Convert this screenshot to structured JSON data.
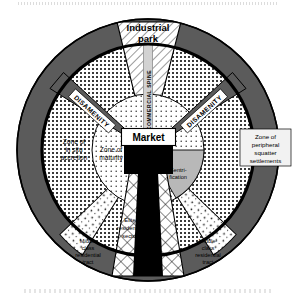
{
  "figure": {
    "type": "concentric-sector diagram"
  },
  "center": {
    "market_label": "Market",
    "cbd_label": "CBD"
  },
  "zones": {
    "industrial_park": "Industrial\npark",
    "industrial_park_line1": "Industrial",
    "industrial_park_line2": "park",
    "commercial_spine": "COMMERCIAL SPINE",
    "disamenity_left": "DISAMENITY",
    "disamenity_right": "DISAMENITY",
    "in_situ_line1": "Zone of",
    "in_situ_line2": "in situ",
    "in_situ_line3": "accretion",
    "maturity_line1": "Zone of",
    "maturity_line2": "maturity",
    "gentrification_line1": "Gentri-",
    "gentrification_line2": "fication",
    "squatter_line1": "Zone of",
    "squatter_line2": "peripheral",
    "squatter_line3": "squatter",
    "squatter_line4": "settlements",
    "elite_line1": "Elite",
    "elite_line2": "residential",
    "elite_line3": "sector",
    "middle_left_line1": "Middle",
    "middle_left_line2": "class",
    "middle_left_line3": "residential",
    "middle_left_line4": "tract",
    "middle_right_line1": "Middle-",
    "middle_right_line2": "class",
    "middle_right_line3": "residential",
    "middle_right_line4": "tract"
  },
  "colors": {
    "outer_ring": "#5b5b5b",
    "spoke_gray": "#5b5b5b",
    "cbd_black": "#000000",
    "gentrification_gray": "#b8b8b8",
    "background": "#ffffff",
    "stroke": "#000000"
  }
}
